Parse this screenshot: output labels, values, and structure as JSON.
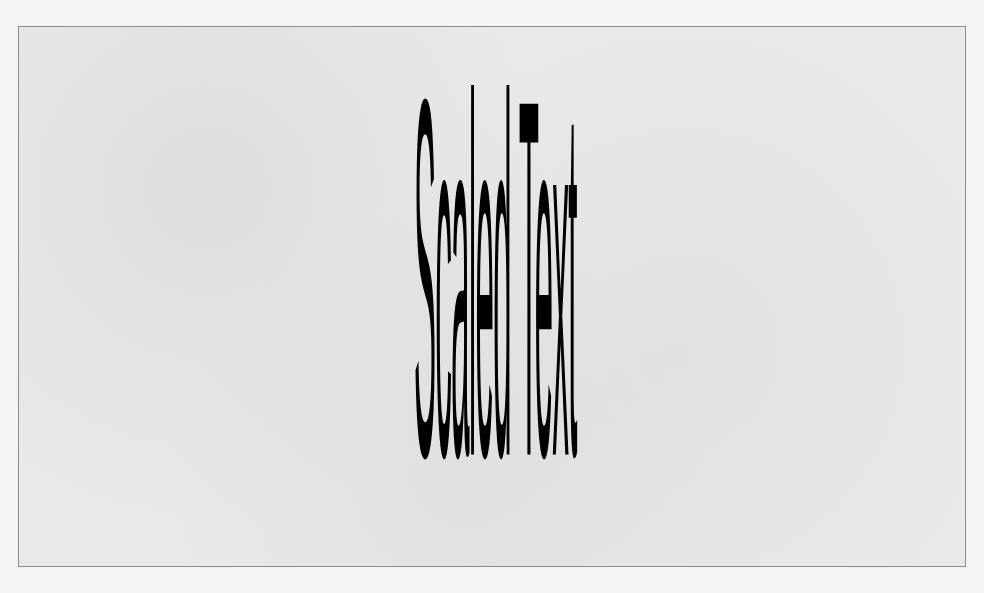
{
  "canvas": {
    "background": "#e9e9e9",
    "border_color": "#8a8a8a"
  },
  "content": {
    "scaled_text": "Scaled Text",
    "text_color": "#000000"
  }
}
